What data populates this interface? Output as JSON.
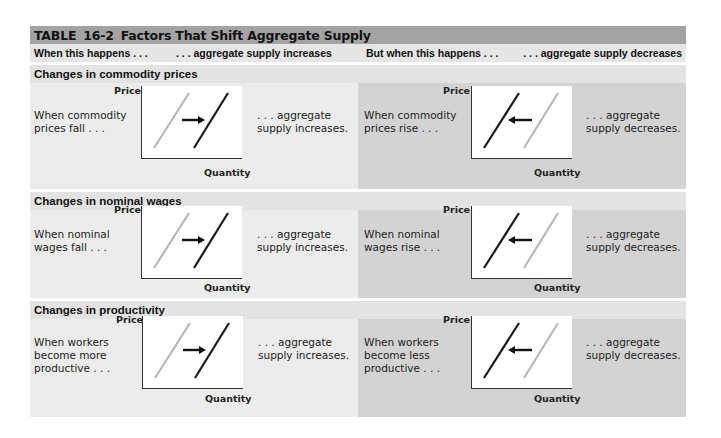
{
  "table": {
    "label": "TABLE",
    "number": "16-2",
    "title": "Factors That Shift Aggregate Supply",
    "columns": [
      "When this happens . . .",
      ". . . aggregate supply increases",
      "But when this happens . . .",
      ". . . aggregate supply decreases"
    ],
    "colors": {
      "title_bar": "#a3a3a3",
      "column_header": "#e6e6e6",
      "increase_panel": "#ececec",
      "decrease_panel": "#d3d3d3",
      "old_curve": "#b8b8b8",
      "new_curve": "#1a1a1a"
    },
    "axis": {
      "y": "Price",
      "x": "Quantity"
    },
    "sections": [
      {
        "title": "Changes in commodity prices",
        "increase": {
          "cause": [
            "When commodity",
            "prices fall . . ."
          ],
          "effect": [
            ". . . aggregate",
            "supply increases."
          ],
          "shift": "right"
        },
        "decrease": {
          "cause": [
            "When commodity",
            "prices rise . . ."
          ],
          "effect": [
            ". . . aggregate",
            "supply decreases."
          ],
          "shift": "left"
        }
      },
      {
        "title": "Changes in nominal wages",
        "increase": {
          "cause": [
            "When nominal",
            "wages fall . . ."
          ],
          "effect": [
            ". . . aggregate",
            "supply increases."
          ],
          "shift": "right"
        },
        "decrease": {
          "cause": [
            "When nominal",
            "wages rise . . ."
          ],
          "effect": [
            ". . . aggregate",
            "supply decreases."
          ],
          "shift": "left"
        }
      },
      {
        "title": "Changes in productivity",
        "increase": {
          "cause": [
            "When workers",
            "become more",
            "productive . . ."
          ],
          "effect": [
            ". . . aggregate",
            "supply increases."
          ],
          "shift": "right"
        },
        "decrease": {
          "cause": [
            "When workers",
            "become less",
            "productive . . ."
          ],
          "effect": [
            ". . . aggregate",
            "supply decreases."
          ],
          "shift": "left"
        }
      }
    ]
  }
}
